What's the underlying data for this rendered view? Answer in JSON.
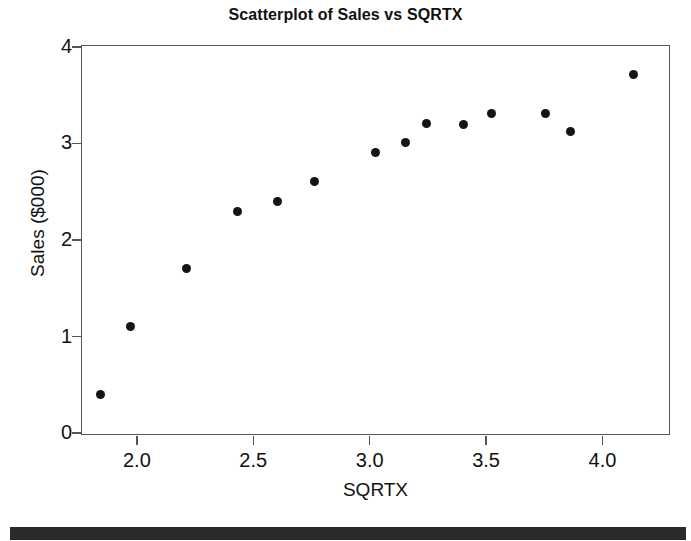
{
  "chart_data": {
    "type": "scatter",
    "title": "Scatterplot of Sales vs SQRTX",
    "xlabel": "SQRTX",
    "ylabel": "Sales ($000)",
    "xlim": [
      1.76,
      4.29
    ],
    "ylim": [
      -0.02,
      4.02
    ],
    "xticks": [
      2.0,
      2.5,
      3.0,
      3.5,
      4.0
    ],
    "xticklabels": [
      "2.0",
      "2.5",
      "3.0",
      "3.5",
      "4.0"
    ],
    "yticks": [
      0,
      1,
      2,
      3,
      4
    ],
    "yticklabels": [
      "0",
      "1",
      "2",
      "3",
      "4"
    ],
    "grid": false,
    "legend": null,
    "marker": "filled-circle",
    "marker_color": "#141414",
    "x": [
      1.84,
      1.97,
      2.21,
      2.43,
      2.6,
      2.76,
      3.02,
      3.15,
      3.24,
      3.4,
      3.52,
      3.75,
      3.86,
      4.13
    ],
    "y": [
      0.41,
      1.11,
      1.71,
      2.31,
      2.41,
      2.62,
      2.92,
      3.02,
      3.22,
      3.21,
      3.32,
      3.32,
      3.13,
      3.72
    ],
    "points": [
      {
        "x": 1.84,
        "y": 0.41
      },
      {
        "x": 1.97,
        "y": 1.11
      },
      {
        "x": 2.21,
        "y": 1.71
      },
      {
        "x": 2.43,
        "y": 2.31
      },
      {
        "x": 2.6,
        "y": 2.41
      },
      {
        "x": 2.76,
        "y": 2.62
      },
      {
        "x": 3.02,
        "y": 2.92
      },
      {
        "x": 3.15,
        "y": 3.02
      },
      {
        "x": 3.24,
        "y": 3.22
      },
      {
        "x": 3.4,
        "y": 3.21
      },
      {
        "x": 3.52,
        "y": 3.32
      },
      {
        "x": 3.75,
        "y": 3.32
      },
      {
        "x": 3.86,
        "y": 3.13
      },
      {
        "x": 4.13,
        "y": 3.72
      }
    ]
  },
  "colors": {
    "marker": "#141414",
    "axis": "#555555",
    "text": "#111111",
    "footer_bar": "#2a2a2a",
    "background": "#ffffff"
  }
}
